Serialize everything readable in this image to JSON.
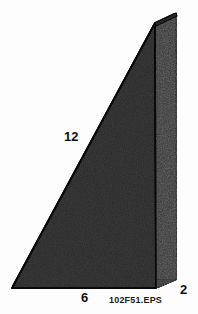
{
  "figure": {
    "caption": "102F51.EPS",
    "background_color": "#fdfdfd",
    "labels": {
      "hypotenuse": "12",
      "base": "6",
      "depth": "2"
    },
    "colors": {
      "front_face": "#6e6e6e",
      "side_face": "#242424",
      "bottom_face": "#1c1c1c",
      "top_face": "#2a2a2a",
      "outline": "#0a0a0a",
      "label_text": "#101010",
      "caption_text": "#1a1a1a"
    },
    "geometry": {
      "front_bottom_left": [
        12,
        288
      ],
      "front_bottom_right": [
        156,
        288
      ],
      "front_top": [
        155,
        23
      ],
      "back_bottom_right": [
        177,
        279
      ],
      "back_top": [
        176,
        13
      ],
      "back_bottom_left": [
        33,
        279
      ]
    },
    "dimensions": {
      "width_px": 198,
      "height_px": 314
    }
  }
}
